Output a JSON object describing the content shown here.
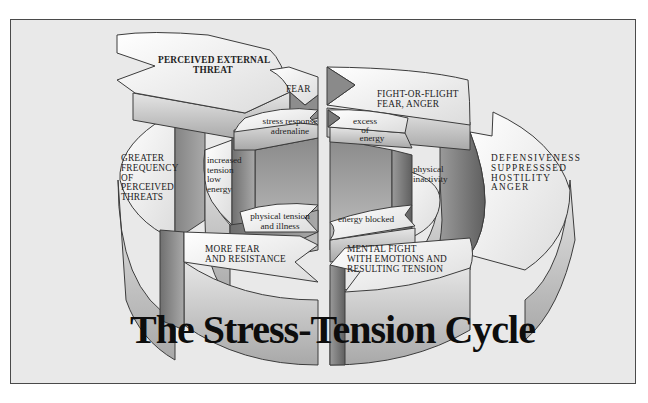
{
  "diagram": {
    "title": "The Stress-Tension Cycle",
    "outer_ring": {
      "perceived_external_threat": "PERCEIVED EXTERNAL THREAT",
      "perceived_external_threat_l1": "PERCEIVED EXTERNAL",
      "perceived_external_threat_l2": "THREAT",
      "fight_or_flight_l1": "FIGHT-OR-FLIGHT",
      "fight_or_flight_l2": "FEAR,  ANGER",
      "defensiveness_l1": "DEFENSIVENESS",
      "defensiveness_l2": "SUPPRESSSED",
      "defensiveness_l3": "HOSTILITY",
      "defensiveness_l4": "ANGER",
      "mental_fight_l1": "MENTAL FIGHT",
      "mental_fight_l2": "WITH EMOTIONS AND",
      "mental_fight_l3": "RESULTING TENSION",
      "more_fear_l1": "MORE FEAR",
      "more_fear_l2": "AND RESISTANCE",
      "greater_freq_l1": "GREATER",
      "greater_freq_l2": "FREQUENCY",
      "greater_freq_l3": "OF",
      "greater_freq_l4": "PERCEIVED",
      "greater_freq_l5": "THREATS"
    },
    "inner_ring": {
      "fear": "FEAR",
      "stress_response_l1": "stress response",
      "stress_response_l2": "adrenaline",
      "excess_l1": "excess",
      "excess_l2": "of",
      "excess_l3": "energy",
      "physical_inactivity_l1": "physical",
      "physical_inactivity_l2": "inactivity",
      "energy_blocked": "energy blocked",
      "physical_tension_l1": "physical tension",
      "physical_tension_l2": "and illness",
      "increased_tension_l1": "increased",
      "increased_tension_l2": "tension",
      "increased_tension_l3": "low",
      "increased_tension_l4": "energy"
    },
    "colors": {
      "background": "#e9e9e9",
      "frame_border": "#4a4a4a",
      "face_light": "#f4f4f4",
      "face_mid": "#b9b9b9",
      "face_dark": "#7e7e7e",
      "text": "#1a1a1a"
    }
  }
}
